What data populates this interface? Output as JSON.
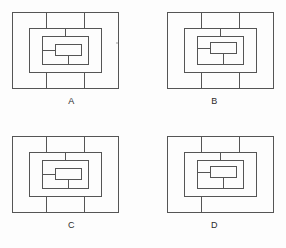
{
  "figure": {
    "kind": "multiple-choice-figure-set",
    "panel_count": 4,
    "background_color": "#fdfdfd",
    "line_color": "#555555",
    "label_color": "#2b2b2b"
  },
  "panels": [
    {
      "id": "A",
      "label": "A",
      "position": "top-left",
      "description": "Four nested rectangles with vertical connector stubs on top and bottom edges and a small solid bar left-of-center in the innermost rectangle",
      "rings": 4,
      "inner_bar": {
        "present": true,
        "alignment": "center-right-of-left-edge",
        "offset_x": 36,
        "offset_y": 43,
        "width": 26,
        "height": 11
      },
      "stubs": {
        "outer_top": 2,
        "outer_bottom": 2,
        "ring2_top": 1,
        "ring2_bottom": 1,
        "ring3_bottom": 1,
        "inner_left_tick": true
      },
      "artifact_speck": {
        "present": true,
        "x": 117,
        "y": 43
      }
    },
    {
      "id": "B",
      "label": "B",
      "position": "top-right",
      "description": "Four nested rectangles; inner assembly shifted right relative to option A, with the small bar sitting higher in the innermost rectangle",
      "rings": 4,
      "inner_bar": {
        "present": true,
        "alignment": "shifted-right",
        "offset_x": 46,
        "offset_y": 41,
        "width": 26,
        "height": 11
      },
      "stubs": {
        "outer_top": 2,
        "outer_bottom": 2,
        "ring2_top": 1,
        "ring2_bottom": 1,
        "ring3_bottom": 1,
        "inner_left_tick": true
      },
      "artifact_speck": {
        "present": false,
        "x": 0,
        "y": 0
      }
    },
    {
      "id": "C",
      "label": "C",
      "position": "bottom-left",
      "description": "Four nested rectangles matching option A's geometry with the small bar left-of-center in the innermost rectangle",
      "rings": 4,
      "inner_bar": {
        "present": true,
        "alignment": "center-right-of-left-edge",
        "offset_x": 36,
        "offset_y": 43,
        "width": 26,
        "height": 11
      },
      "stubs": {
        "outer_top": 2,
        "outer_bottom": 2,
        "ring2_top": 1,
        "ring2_bottom": 1,
        "ring3_bottom": 1,
        "inner_left_tick": true
      },
      "artifact_speck": {
        "present": false,
        "x": 0,
        "y": 0
      }
    },
    {
      "id": "D",
      "label": "D",
      "position": "bottom-right",
      "description": "Four nested rectangles; inner assembly shifted right with only a single bottom connector stub on the outer rectangle",
      "rings": 4,
      "inner_bar": {
        "present": true,
        "alignment": "shifted-right",
        "offset_x": 46,
        "offset_y": 41,
        "width": 26,
        "height": 11
      },
      "stubs": {
        "outer_top": 2,
        "outer_bottom": 1,
        "ring2_top": 1,
        "ring2_bottom": 1,
        "ring3_bottom": 1,
        "inner_left_tick": true
      },
      "artifact_speck": {
        "present": false,
        "x": 0,
        "y": 0
      }
    }
  ]
}
